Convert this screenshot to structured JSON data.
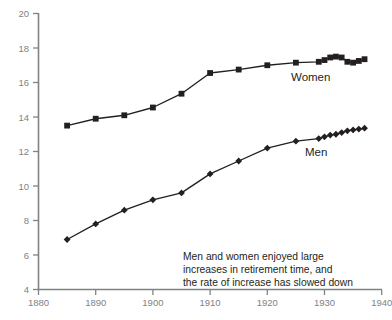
{
  "chart_data": {
    "type": "line",
    "title": "",
    "subtitle": "",
    "xlabel": "",
    "ylabel": "",
    "xlim": [
      1880,
      1940
    ],
    "ylim": [
      4,
      20
    ],
    "xticks": [
      1880,
      1890,
      1900,
      1910,
      1920,
      1930,
      1940
    ],
    "yticks": [
      4,
      6,
      8,
      10,
      12,
      14,
      16,
      18,
      20
    ],
    "grid": false,
    "legend_position": "inline-labels",
    "annotations": [
      {
        "name": "summary-note",
        "lines": [
          "Men and women enjoyed large",
          "increases in retirement time, and",
          "the rate of increase has slowed down"
        ]
      }
    ],
    "series": [
      {
        "name": "Women",
        "marker": "square",
        "label": "Women",
        "x": [
          1885,
          1890,
          1895,
          1900,
          1905,
          1910,
          1915,
          1920,
          1925,
          1929,
          1930,
          1931,
          1932,
          1933,
          1934,
          1935,
          1936,
          1937
        ],
        "values": [
          13.5,
          13.9,
          14.1,
          14.55,
          15.35,
          16.55,
          16.75,
          17.0,
          17.15,
          17.2,
          17.3,
          17.45,
          17.5,
          17.45,
          17.2,
          17.15,
          17.25,
          17.35
        ]
      },
      {
        "name": "Men",
        "marker": "diamond",
        "label": "Men",
        "x": [
          1885,
          1890,
          1895,
          1900,
          1905,
          1910,
          1915,
          1920,
          1925,
          1929,
          1930,
          1931,
          1932,
          1933,
          1934,
          1935,
          1936,
          1937
        ],
        "values": [
          6.9,
          7.8,
          8.6,
          9.2,
          9.6,
          10.7,
          11.45,
          12.2,
          12.6,
          12.75,
          12.85,
          12.95,
          13.0,
          13.1,
          13.2,
          13.25,
          13.3,
          13.35
        ]
      }
    ]
  },
  "axis": {
    "y_tick_labels": [
      "20",
      "18",
      "16",
      "14",
      "12",
      "10",
      "8",
      "6",
      "4"
    ],
    "x_tick_labels": [
      "1880",
      "1890",
      "1900",
      "1910",
      "1920",
      "1930",
      "1940"
    ]
  },
  "labels": {
    "women": "Women",
    "men": "Men"
  },
  "annotation": {
    "line1": "Men and women enjoyed large",
    "line2": "increases in retirement time, and",
    "line3": "the rate of increase has slowed down"
  }
}
